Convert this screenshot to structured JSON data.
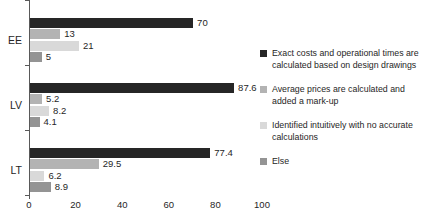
{
  "chart_data": {
    "type": "bar",
    "orientation": "horizontal",
    "title": "",
    "xlabel": "",
    "ylabel": "",
    "categories": [
      "EE",
      "LV",
      "LT"
    ],
    "series": [
      {
        "name": "Exact costs and operational times are calculated based on design drawings",
        "color": "#262626",
        "values": [
          70,
          87.6,
          77.4
        ]
      },
      {
        "name": "Average prices are calculated and added a mark-up",
        "color": "#b3b3b3",
        "values": [
          13,
          5.2,
          29.5
        ]
      },
      {
        "name": "Identified intuitively with no accurate calculations",
        "color": "#d9d9d9",
        "values": [
          21,
          8.2,
          6.2
        ]
      },
      {
        "name": "Else",
        "color": "#949494",
        "values": [
          5,
          4.1,
          8.9
        ]
      }
    ],
    "xlim": [
      0,
      100
    ],
    "xticks": [
      0,
      20,
      40,
      60,
      80,
      100
    ],
    "data_labels": true,
    "grid": false,
    "legend_position": "right"
  },
  "colors": {
    "axis": "#595959",
    "text": "#262626",
    "background": "#ffffff"
  }
}
